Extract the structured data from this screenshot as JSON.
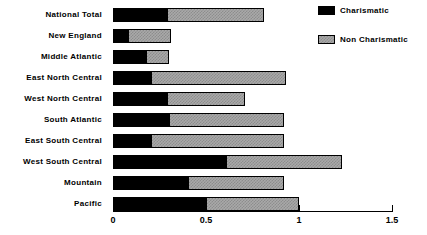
{
  "chart_data": {
    "type": "bar",
    "orientation": "horizontal",
    "stacked": true,
    "title": "",
    "xlabel": "",
    "ylabel": "",
    "xlim": [
      0,
      1.5
    ],
    "xticks": [
      0,
      0.5,
      1,
      1.5
    ],
    "xtick_labels": [
      "0",
      "0.5",
      "1",
      "1.5"
    ],
    "grid": false,
    "legend_position": "top-right",
    "categories": [
      "National Total",
      "New England",
      "Middle Atlantic",
      "East North Central",
      "West North Central",
      "South Atlantic",
      "East South Central",
      "West South Central",
      "Mountain",
      "Pacific"
    ],
    "series": [
      {
        "name": "Charismatic",
        "color": "#000000",
        "values": [
          0.29,
          0.08,
          0.18,
          0.2,
          0.29,
          0.3,
          0.2,
          0.61,
          0.4,
          0.5
        ]
      },
      {
        "name": "Non Charismatic",
        "color": "#a9a9a9",
        "values": [
          0.52,
          0.23,
          0.12,
          0.73,
          0.42,
          0.62,
          0.72,
          0.62,
          0.52,
          0.5
        ]
      }
    ],
    "totals": [
      0.81,
      0.31,
      0.3,
      0.93,
      0.71,
      0.92,
      0.92,
      1.23,
      0.92,
      1.0
    ]
  },
  "legend": {
    "items": [
      {
        "label": "Charismatic",
        "swatch": "black-swatch"
      },
      {
        "label": "Non Charismatic",
        "swatch": "gray-hatched-swatch"
      }
    ]
  },
  "colors": {
    "charismatic": "#000000",
    "non_charismatic": "#a9a9a9",
    "axis": "#000000",
    "background": "#ffffff"
  }
}
